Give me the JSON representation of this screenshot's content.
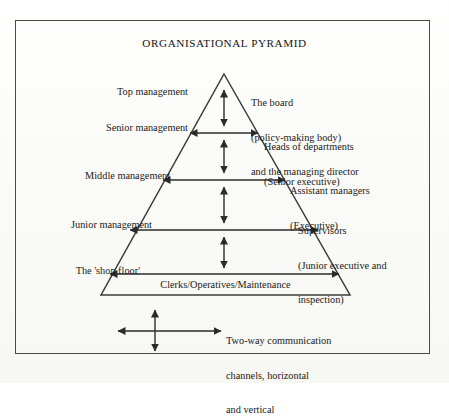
{
  "diagram": {
    "title": "ORGANISATIONAL PYRAMID",
    "left_labels": [
      {
        "name": "top-management",
        "text": "Top management"
      },
      {
        "name": "senior-management",
        "text": "Senior management"
      },
      {
        "name": "middle-management",
        "text": "Middle management"
      },
      {
        "name": "junior-management",
        "text": "Junior management"
      },
      {
        "name": "shop-floor",
        "text": "The 'shop floor'"
      }
    ],
    "right_labels": [
      {
        "name": "board",
        "lines": [
          "The board",
          "(policy-making body)",
          "and the managing director"
        ]
      },
      {
        "name": "heads",
        "lines": [
          "Heads of departments",
          "(Senior executive)"
        ]
      },
      {
        "name": "assistant",
        "lines": [
          "Assistant managers",
          "(Executive)"
        ]
      },
      {
        "name": "supervisors",
        "lines": [
          "Supervisors",
          "(Junior executive and",
          "inspection)"
        ]
      }
    ],
    "base_label": "Clerks/Operatives/Maintenance",
    "legend": {
      "lines": [
        "Two-way communication",
        "channels, horizontal",
        "and vertical"
      ]
    },
    "colors": {
      "ink": "#1a1a1a",
      "line": "#3b3b3b",
      "frame": "#4a4a4a",
      "paper": "#fdfdfb"
    }
  }
}
